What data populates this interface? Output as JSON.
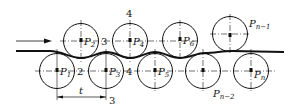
{
  "diagram": {
    "rollers_upper": [
      {
        "label": "P",
        "sub": "2"
      },
      {
        "label": "P",
        "sub": "4"
      },
      {
        "label": "P",
        "sub": "6"
      },
      {
        "label": "P",
        "sub": "n−1"
      }
    ],
    "rollers_lower": [
      {
        "label": "P",
        "sub": "1"
      },
      {
        "label": "P",
        "sub": "3"
      },
      {
        "label": "P",
        "sub": "5"
      },
      {
        "label": "P",
        "sub": "n−2"
      },
      {
        "label": "P",
        "sub": "n"
      }
    ],
    "section_marks": [
      "2",
      "3",
      "4",
      "4",
      "3"
    ],
    "pitch_label": "t"
  }
}
